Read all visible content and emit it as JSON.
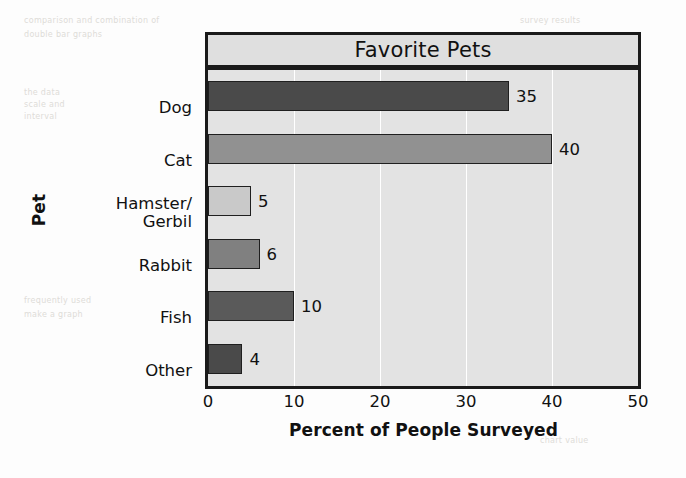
{
  "chart_data": {
    "type": "bar",
    "orientation": "horizontal",
    "title": "Favorite Pets",
    "xlabel": "Percent of People Surveyed",
    "ylabel": "Pet",
    "categories": [
      "Dog",
      "Cat",
      "Hamster/\nGerbil",
      "Rabbit",
      "Fish",
      "Other"
    ],
    "values": [
      35,
      40,
      5,
      6,
      10,
      4
    ],
    "value_labels": [
      "35",
      "40",
      "5",
      "6",
      "10",
      "4"
    ],
    "bar_colors": [
      "#4a4a4a",
      "#919191",
      "#c9c9c9",
      "#808080",
      "#5a5a5a",
      "#4a4a4a"
    ],
    "xlim": [
      0,
      50
    ],
    "xticks": [
      0,
      10,
      20,
      30,
      40,
      50
    ],
    "xtick_labels": [
      "0",
      "10",
      "20",
      "30",
      "40",
      "50"
    ],
    "grid": true,
    "grid_axis": "x",
    "grid_color": "#ffffff",
    "plot_background": "#e3e3e3",
    "title_background": "#dfdfdf",
    "frame_color": "#1a1a1a",
    "legend": "none"
  },
  "background_marks": [
    {
      "text": "comparison and combination of",
      "x": 24,
      "y": 16
    },
    {
      "text": "double bar graphs",
      "x": 24,
      "y": 30
    },
    {
      "text": "the data",
      "x": 24,
      "y": 88
    },
    {
      "text": "scale and",
      "x": 24,
      "y": 100
    },
    {
      "text": "interval",
      "x": 24,
      "y": 112
    },
    {
      "text": "frequently used",
      "x": 24,
      "y": 296
    },
    {
      "text": "make a graph",
      "x": 24,
      "y": 310
    },
    {
      "text": "survey results",
      "x": 520,
      "y": 16
    },
    {
      "text": "percentage",
      "x": 530,
      "y": 206
    },
    {
      "text": "of students",
      "x": 530,
      "y": 218
    },
    {
      "text": "chart value",
      "x": 540,
      "y": 436
    }
  ]
}
